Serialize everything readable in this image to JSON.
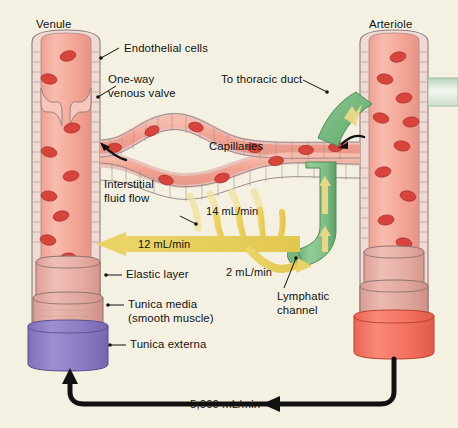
{
  "figure": {
    "background_color": "#f4f1e3"
  },
  "labels": {
    "venule": "Venule",
    "arteriole": "Arteriole",
    "endothelial_cells": "Endothelial cells",
    "one_way_venous_valve_line1": "One-way",
    "one_way_venous_valve_line2": "venous valve",
    "to_thoracic_duct": "To thoracic duct",
    "capillaries": "Capillaries",
    "interstitial_fluid_flow_line1": "Interstitial",
    "interstitial_fluid_flow_line2": "fluid flow",
    "elastic_layer": "Elastic layer",
    "tunica_media_line1": "Tunica media",
    "tunica_media_line2": "(smooth muscle)",
    "tunica_externa": "Tunica externa",
    "lymphatic_channel_line1": "Lymphatic",
    "lymphatic_channel_line2": "channel"
  },
  "flow_values": {
    "filtration": "14 mL/min",
    "reabsorption": "12 mL/min",
    "lymphatic": "2 mL/min",
    "cardiac_output": "5,000 mL/min"
  },
  "colors": {
    "background": "#f4f1e3",
    "lumen_pink": "#f5a898",
    "lumen_pink_light": "#f7bdb0",
    "vessel_wall": "#e8c6c4",
    "wall_outline": "#9a8b8b",
    "rbc_red": "#d6443c",
    "elastic_layer": "#e8a89e",
    "tunica_media": "#dfa9a0",
    "tunica_externa": "#8b7bc4",
    "arteriole_cuff": "#f2705f",
    "lymph_green": "#7dbe84",
    "lymph_green_dark": "#5ea368",
    "fluid_yellow": "#ead468",
    "fluid_yellow_pale": "#f2e49a",
    "arrow_black": "#111111",
    "leader_line": "#111111"
  }
}
